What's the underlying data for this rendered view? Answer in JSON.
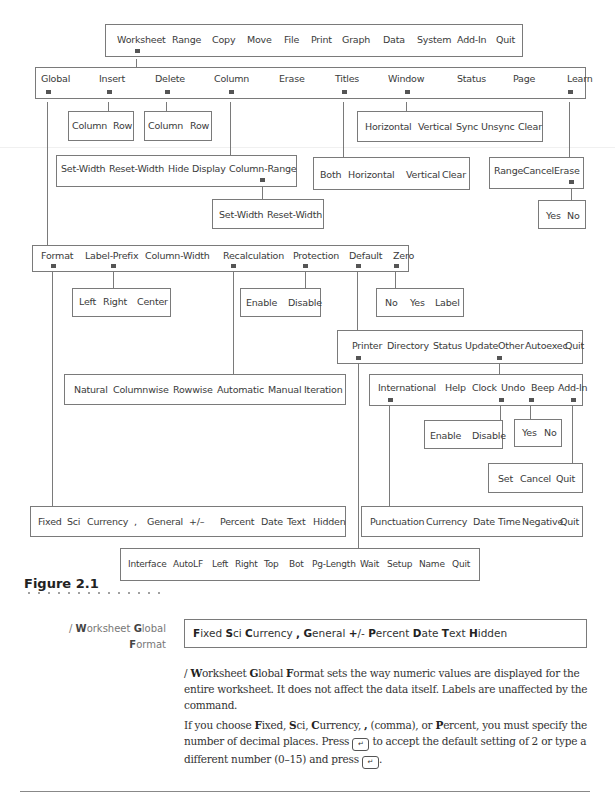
{
  "menu_tree": {
    "main": [
      "Worksheet",
      "Range",
      "Copy",
      "Move",
      "File",
      "Print",
      "Graph",
      "Data",
      "System",
      "Add-In",
      "Quit"
    ],
    "worksheet": [
      "Global",
      "Insert",
      "Delete",
      "Column",
      "Erase",
      "Titles",
      "Window",
      "Status",
      "Page",
      "Learn"
    ],
    "insert": [
      "Column",
      "Row"
    ],
    "delete": [
      "Column",
      "Row"
    ],
    "column": [
      "Set-Width",
      "Reset-Width",
      "Hide",
      "Display",
      "Column-Range"
    ],
    "column_range": [
      "Set-Width",
      "Reset-Width"
    ],
    "window": [
      "Horizontal",
      "Vertical",
      "Sync",
      "Unsync",
      "Clear"
    ],
    "titles": [
      "Both",
      "Horizontal",
      "Vertical",
      "Clear"
    ],
    "learn": [
      "Range",
      "Cancel",
      "Erase"
    ],
    "learn_erase": [
      "Yes",
      "No"
    ],
    "global": [
      "Format",
      "Label-Prefix",
      "Column-Width",
      "Recalculation",
      "Protection",
      "Default",
      "Zero"
    ],
    "label_prefix": [
      "Left",
      "Right",
      "Center"
    ],
    "protection": [
      "Enable",
      "Disable"
    ],
    "zero": [
      "No",
      "Yes",
      "Label"
    ],
    "default": [
      "Printer",
      "Directory",
      "Status",
      "Update",
      "Other",
      "Autoexec",
      "Quit"
    ],
    "recalculation": [
      "Natural",
      "Columnwise",
      "Rowwise",
      "Automatic",
      "Manual",
      "Iteration"
    ],
    "other": [
      "International",
      "Help",
      "Clock",
      "Undo",
      "Beep",
      "Add-In"
    ],
    "undo": [
      "Enable",
      "Disable"
    ],
    "beep": [
      "Yes",
      "No"
    ],
    "addin": [
      "Set",
      "Cancel",
      "Quit"
    ],
    "format": [
      "Fixed",
      "Sci",
      "Currency",
      ",",
      "General",
      "+/–",
      "Percent",
      "Date",
      "Text",
      "Hidden"
    ],
    "international": [
      "Punctuation",
      "Currency",
      "Date",
      "Time",
      "Negative",
      "Quit"
    ],
    "printer": [
      "Interface",
      "AutoLF",
      "Left",
      "Right",
      "Top",
      "Bot",
      "Pg-Length",
      "Wait",
      "Setup",
      "Name",
      "Quit"
    ]
  },
  "figure_caption": "Figure 2.1",
  "sidebar": {
    "slash": "/ ",
    "w_key": "W",
    "w_rest": "orksheet ",
    "g_key": "G",
    "g_rest": "lobal",
    "f_key": "F",
    "f_rest": "ormat"
  },
  "highlight": [
    {
      "key": "F",
      "rest": "ixed "
    },
    {
      "key": "S",
      "rest": "ci "
    },
    {
      "key": "C",
      "rest": "urrency "
    },
    {
      "key": ",",
      "rest": " "
    },
    {
      "key": "G",
      "rest": "eneral  "
    },
    {
      "key": "+",
      "rest": "/- "
    },
    {
      "key": "P",
      "rest": "ercent "
    },
    {
      "key": "D",
      "rest": "ate "
    },
    {
      "key": "T",
      "rest": "ext "
    },
    {
      "key": "H",
      "rest": "idden"
    }
  ],
  "body": {
    "p1_a": "/ ",
    "p1_w": "W",
    "p1_b": "orksheet ",
    "p1_g": "G",
    "p1_c": "lobal ",
    "p1_f": "F",
    "p1_d": "ormat sets the way numeric values are displayed for the entire worksheet. It does not affect the data itself. Labels are unaffected by the command.",
    "p2_a": "If you choose ",
    "p2_fixed": "F",
    "p2_b": "ixed, ",
    "p2_sci": "S",
    "p2_c": "ci, ",
    "p2_cur": "C",
    "p2_d": "urrency, ",
    "p2_comma": ",",
    "p2_e": " (comma), or ",
    "p2_pct": "P",
    "p2_f": "ercent, you must specify the number of decimal places. Press ",
    "p2_g": " to accept the default setting of 2 or type a different number (0–15) and press ",
    "p2_h": ".",
    "enter_key_glyph": "↵"
  }
}
